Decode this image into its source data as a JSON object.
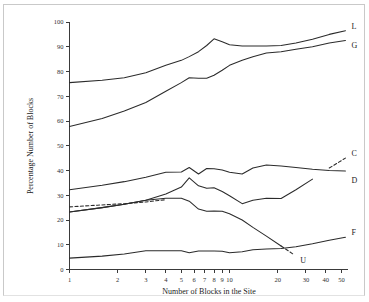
{
  "figure": {
    "background_color": "#ffffff",
    "line_color": "#2b2b2b",
    "frame_color": "#c9c9c9"
  },
  "chart_data": {
    "type": "line",
    "title": "",
    "xlabel": "Number of Blocks in the Site",
    "ylabel": "Percentage Number of Blocks",
    "xscale": "log",
    "xlim": [
      1,
      55
    ],
    "ylim": [
      0,
      100
    ],
    "grid": false,
    "legend_position": "right-of-line-ends",
    "xticks": [
      1,
      2,
      3,
      4,
      5,
      6,
      7,
      8,
      9,
      10,
      20,
      30,
      40,
      50
    ],
    "xtick_labels": [
      "1",
      "2",
      "3",
      "4",
      "5",
      "6",
      "7",
      "8",
      "9",
      "10",
      "20",
      "30",
      "40",
      "50"
    ],
    "yticks": [
      0,
      10,
      20,
      30,
      40,
      50,
      60,
      70,
      80,
      90,
      100
    ],
    "ytick_labels": [
      "0",
      "10",
      "20",
      "30",
      "40",
      "50",
      "60",
      "70",
      "80",
      "90",
      "100"
    ],
    "series": [
      {
        "name": "L",
        "label": "L",
        "style": "solid",
        "x": [
          1,
          1.6,
          2.2,
          3,
          4,
          5,
          5.6,
          6.4,
          7.2,
          8,
          9,
          10,
          12,
          14,
          17,
          21,
          26,
          33,
          42,
          53
        ],
        "values": [
          75.5,
          76.5,
          77.5,
          79.5,
          82.5,
          84.5,
          86,
          88,
          90.5,
          93.2,
          92,
          90.8,
          90.3,
          90.3,
          90.3,
          90.5,
          91.5,
          93,
          95,
          96.5
        ]
      },
      {
        "name": "G",
        "label": "G",
        "style": "solid",
        "x": [
          1,
          1.6,
          2.2,
          3,
          4,
          5,
          5.6,
          6.4,
          7.2,
          8,
          9,
          10,
          12,
          14,
          17,
          21,
          26,
          33,
          42,
          53
        ],
        "values": [
          57.8,
          61,
          64,
          67.5,
          72,
          75.5,
          77.5,
          77.3,
          77.3,
          78.5,
          80.5,
          82.5,
          84.5,
          86,
          87.5,
          88,
          89,
          90,
          91.5,
          92.5
        ]
      },
      {
        "name": "D",
        "label": "D",
        "style": "solid",
        "x": [
          1,
          1.6,
          2.2,
          3,
          4,
          5,
          5.6,
          6.4,
          7.2,
          8,
          9,
          10,
          12,
          14,
          17,
          21,
          26,
          33,
          42,
          53
        ],
        "values": [
          32.2,
          34,
          35.5,
          37.3,
          39.3,
          39.4,
          41.2,
          38.6,
          40.8,
          40.7,
          40.2,
          39.3,
          38.6,
          41,
          42.2,
          41.8,
          41.2,
          40.5,
          40,
          39.8
        ]
      },
      {
        "name": "C",
        "label": "C",
        "style": "solid-with-dashed-tail",
        "dashed_from_x": 34,
        "x": [
          1,
          1.6,
          2.2,
          3,
          4,
          5,
          5.6,
          6.4,
          7.2,
          8,
          9,
          10,
          12,
          14,
          17,
          21,
          26,
          33,
          42,
          53
        ],
        "values": [
          23.2,
          25,
          26.4,
          28,
          30.5,
          33.3,
          37,
          33.8,
          32.8,
          33,
          31.5,
          29.8,
          26.6,
          28,
          28.8,
          28.7,
          32.2,
          36.5,
          41,
          45
        ],
        "dashed_segment": {
          "x": [
            1,
            1.5,
            2.2,
            3,
            4
          ],
          "values": [
            25.3,
            26,
            26.6,
            27.3,
            28.2
          ]
        }
      },
      {
        "name": "U",
        "label": "U",
        "style": "solid-with-dashed-tail",
        "dashed_from_x": 21,
        "x": [
          1,
          1.6,
          2.2,
          3,
          4,
          5,
          5.6,
          6.4,
          7.2,
          8,
          9,
          10,
          12,
          14,
          17,
          21,
          25
        ],
        "values": [
          23.2,
          25,
          26.4,
          28,
          28.8,
          28.8,
          27.6,
          24.4,
          23.5,
          23.6,
          23.5,
          22.5,
          20,
          17,
          13.5,
          9.5,
          6.2
        ]
      },
      {
        "name": "F",
        "label": "F",
        "style": "solid",
        "x": [
          1,
          1.6,
          2.2,
          3,
          4,
          5,
          5.6,
          6.4,
          7.2,
          8,
          9,
          10,
          12,
          14,
          17,
          21,
          26,
          33,
          42,
          53
        ],
        "values": [
          4.6,
          5.4,
          6.3,
          7.6,
          7.6,
          7.6,
          6.8,
          7.5,
          7.5,
          7.5,
          7.4,
          6.8,
          7.2,
          8,
          8.3,
          8.5,
          9.2,
          10.4,
          11.8,
          13
        ]
      }
    ],
    "series_labels": [
      {
        "name": "L",
        "text": "L"
      },
      {
        "name": "G",
        "text": "G"
      },
      {
        "name": "C",
        "text": "C"
      },
      {
        "name": "D",
        "text": "D"
      },
      {
        "name": "F",
        "text": "F"
      },
      {
        "name": "U",
        "text": "U"
      }
    ]
  }
}
